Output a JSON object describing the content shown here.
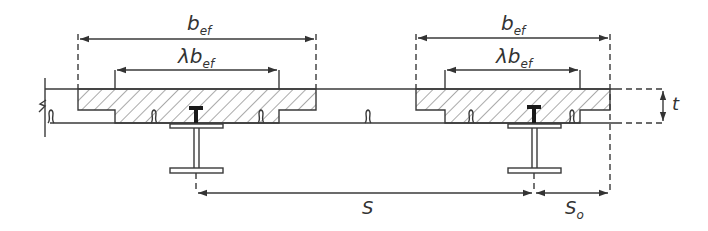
{
  "diagram": {
    "type": "composite-slab-cross-section",
    "labels": {
      "b_ef_left": "b",
      "b_ef_left_sub": "ef",
      "lambda_b_ef_left": "λb",
      "lambda_b_ef_left_sub": "ef",
      "b_ef_right": "b",
      "b_ef_right_sub": "ef",
      "lambda_b_ef_right": "λb",
      "lambda_b_ef_right_sub": "ef",
      "spacing": "S",
      "edge_spacing": "S",
      "edge_spacing_sub": "o",
      "thickness": "t"
    },
    "colors": {
      "line": "#3a3a3a",
      "hatch": "#555555",
      "background": "#ffffff"
    }
  }
}
